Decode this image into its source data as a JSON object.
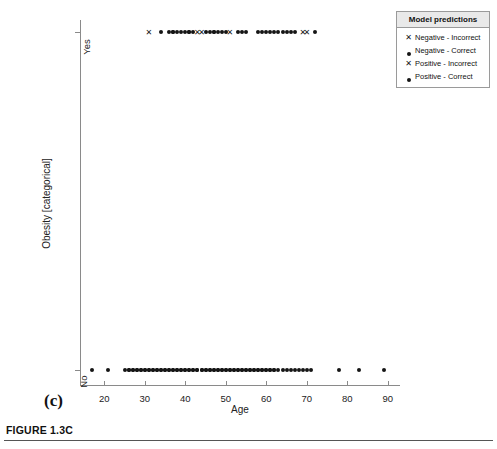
{
  "figure": {
    "caption": "FIGURE 1.3C",
    "panel_label": "(c)"
  },
  "legend": {
    "title": "Model predictions",
    "position": "top-right-outside",
    "entries": [
      {
        "marker": "x-icon",
        "label": "Negative - Incorrect"
      },
      {
        "marker": "dot-icon",
        "label": "Negative - Correct"
      },
      {
        "marker": "x-icon",
        "label": "Positive - Incorrect"
      },
      {
        "marker": "dot-icon",
        "label": "Positive - Correct"
      }
    ]
  },
  "chart_data": {
    "type": "scatter",
    "title": "",
    "xlabel": "Age",
    "ylabel": "Obesity [categorical]",
    "xlim": [
      14,
      93
    ],
    "xticks": [
      20,
      30,
      40,
      50,
      60,
      70,
      80,
      90
    ],
    "xticklabels": [
      "20",
      "30",
      "40",
      "50",
      "60",
      "70",
      "80",
      "90"
    ],
    "ycategories": [
      "No",
      "Yes"
    ],
    "yticklabels": [
      "No",
      "Yes"
    ],
    "grid": false,
    "marker_color": "#151515",
    "series": [
      {
        "name": "Negative - Incorrect",
        "marker": "x",
        "y": "Yes",
        "x": [
          31,
          43,
          44,
          51,
          69,
          70
        ]
      },
      {
        "name": "Negative - Correct",
        "marker": "dot",
        "y": "Yes",
        "x": [
          34,
          36,
          37,
          37,
          38,
          39,
          40,
          41,
          41,
          42,
          45,
          46,
          47,
          47,
          48,
          49,
          50,
          53,
          54,
          55,
          58,
          59,
          60,
          61,
          62,
          63,
          64,
          65,
          66,
          67,
          72
        ]
      },
      {
        "name": "Positive - Incorrect",
        "marker": "x",
        "y": "No",
        "x": []
      },
      {
        "name": "Positive - Correct",
        "marker": "dot",
        "y": "No",
        "x": [
          17,
          21,
          25,
          26,
          26,
          27,
          27,
          28,
          28,
          29,
          29,
          30,
          30,
          31,
          31,
          32,
          32,
          33,
          33,
          34,
          34,
          35,
          35,
          36,
          36,
          37,
          37,
          38,
          38,
          39,
          39,
          40,
          40,
          41,
          41,
          42,
          42,
          43,
          43,
          44,
          44,
          45,
          45,
          46,
          46,
          47,
          47,
          48,
          48,
          49,
          49,
          50,
          50,
          51,
          51,
          52,
          52,
          53,
          53,
          54,
          54,
          55,
          55,
          56,
          56,
          57,
          57,
          58,
          58,
          59,
          59,
          60,
          60,
          61,
          61,
          62,
          62,
          63,
          64,
          65,
          66,
          67,
          68,
          69,
          70,
          71,
          78,
          83,
          89
        ]
      }
    ]
  }
}
